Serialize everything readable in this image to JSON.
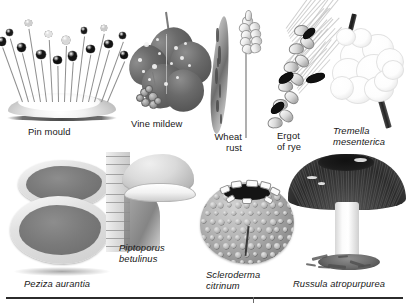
{
  "plate": {
    "title": "Fungi illustration plate",
    "background_color": "#ffffff",
    "rule_color": "#2b2b2b",
    "ink_color": "#171717"
  },
  "figures": [
    {
      "id": "pin-mould",
      "caption": "Pin mould",
      "caption_style": "roman",
      "caption_lines": 1,
      "subject": "pin mould (Mucor) sporangiophores rising from a white mycelial mound",
      "row": 1,
      "column": 1
    },
    {
      "id": "vine-mildew",
      "caption": "Vine mildew",
      "caption_style": "roman",
      "caption_lines": 1,
      "subject": "grape vine leaf with powdery mildew spots and a small bunch of grapes",
      "row": 1,
      "column": 2
    },
    {
      "id": "wheat-rust",
      "caption": "Wheat\nrust",
      "caption_style": "roman",
      "caption_lines": 2,
      "subject": "wheat leaf blade with rust streaks beside a wheat ear",
      "row": 1,
      "column": 3
    },
    {
      "id": "ergot-of-rye",
      "caption": "Ergot\nof rye",
      "caption_style": "roman",
      "caption_lines": 2,
      "subject": "rye ear with long awns bearing black curved ergot bodies",
      "row": 1,
      "column": 4
    },
    {
      "id": "tremella-mesenterica",
      "caption": "Tremella\nmesenterica",
      "caption_style": "italic",
      "caption_lines": 2,
      "subject": "pale convoluted jelly fungus mass on a dark twig",
      "row": 1,
      "column": 5
    },
    {
      "id": "peziza-aurantia",
      "caption": "Peziza aurantia",
      "caption_style": "italic",
      "caption_lines": 1,
      "subject": "two overlapping cup fungi with wavy pale rims and grey inner surfaces",
      "row": 2,
      "column": 1
    },
    {
      "id": "piptoporus-betulinus",
      "caption": "Piptoporus\nbetulinus",
      "caption_style": "italic",
      "caption_lines": 2,
      "subject": "birch polypore bracket projecting from birch bark",
      "row": 2,
      "column": 2
    },
    {
      "id": "scleroderma-citrinum",
      "caption": "Scleroderma\ncitrinum",
      "caption_style": "italic",
      "caption_lines": 2,
      "subject": "warted earthball with a dark split opening at the apex",
      "row": 2,
      "column": 3
    },
    {
      "id": "russula-atropurpurea",
      "caption": "Russula atropurpurea",
      "caption_style": "italic",
      "caption_lines": 1,
      "subject": "dark purple-capped russula with white stem on leaf litter",
      "row": 2,
      "column": 4
    }
  ]
}
